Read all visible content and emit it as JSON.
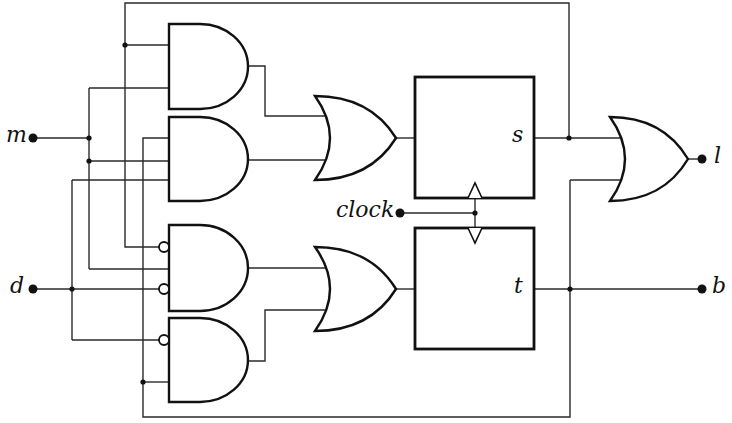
{
  "diagram": {
    "type": "sequential-logic-circuit",
    "inputs": [
      {
        "id": "m",
        "label": "m"
      },
      {
        "id": "d",
        "label": "d"
      },
      {
        "id": "clock",
        "label": "clock"
      }
    ],
    "outputs": [
      {
        "id": "l",
        "label": "l"
      },
      {
        "id": "b",
        "label": "b"
      }
    ],
    "flip_flops": [
      {
        "id": "ff-s",
        "label": "s"
      },
      {
        "id": "ff-t",
        "label": "t"
      }
    ],
    "gates": [
      {
        "id": "and-1",
        "type": "AND",
        "inputs": [
          "s",
          "m"
        ]
      },
      {
        "id": "and-2",
        "type": "AND",
        "inputs": [
          "t",
          "m",
          "d"
        ]
      },
      {
        "id": "and-3",
        "type": "AND",
        "inputs": [
          "NOT s",
          "m",
          "NOT d"
        ]
      },
      {
        "id": "and-4",
        "type": "AND",
        "inputs": [
          "NOT d",
          "t"
        ]
      },
      {
        "id": "or-1",
        "type": "OR",
        "inputs": [
          "and-1",
          "and-2"
        ],
        "drives": "s"
      },
      {
        "id": "or-2",
        "type": "OR",
        "inputs": [
          "and-3",
          "and-4"
        ],
        "drives": "t"
      },
      {
        "id": "or-3",
        "type": "OR",
        "inputs": [
          "s",
          "t"
        ],
        "drives": "l"
      }
    ],
    "colors": {
      "ink": "#111111",
      "background": "#ffffff"
    }
  }
}
